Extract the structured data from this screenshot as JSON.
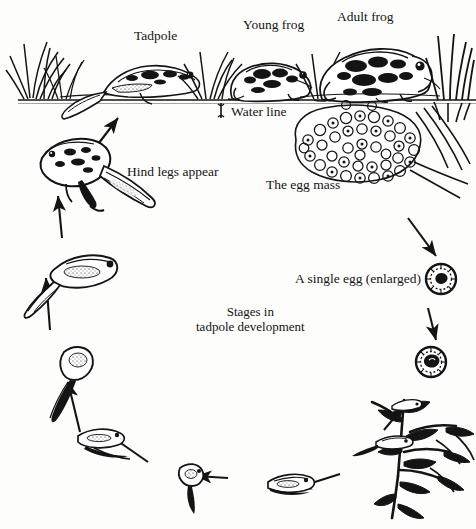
{
  "diagram": {
    "background_color": "#fdfdfc",
    "ink_color": "#141414",
    "caption": {
      "line1": "Stages in",
      "line2": "tadpole development"
    },
    "labels": [
      {
        "id": "tadpole",
        "text": "Tadpole"
      },
      {
        "id": "young_frog",
        "text": "Young frog"
      },
      {
        "id": "adult_frog",
        "text": "Adult frog"
      },
      {
        "id": "water_line",
        "text": "Water line"
      },
      {
        "id": "hind_legs",
        "text": "Hind legs appear"
      },
      {
        "id": "egg_mass",
        "text": "The egg mass"
      },
      {
        "id": "single_egg",
        "text": "A single egg (enlarged)"
      }
    ],
    "scene": {
      "name": "pond-bank-scene",
      "elements": [
        "grass-tufts",
        "tadpole-on-bank",
        "young-frog",
        "adult-frog",
        "reeds",
        "water-surface-line"
      ]
    },
    "cycle_stages": [
      "egg-mass",
      "single-egg-enlarged",
      "developing-egg",
      "hatchlings-on-plant",
      "early-tadpole",
      "tadpole-with-tail",
      "growing-tadpole",
      "tadpole-larger",
      "tadpole-with-hind-legs",
      "young-frog-emerging"
    ]
  }
}
